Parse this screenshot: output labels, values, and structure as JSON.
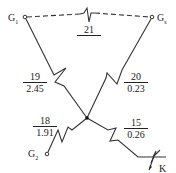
{
  "nodes": {
    "g1": {
      "label": "G",
      "sub": "1"
    },
    "gs": {
      "label": "G",
      "sub": "s"
    },
    "g2": {
      "label": "G",
      "sub": "2"
    },
    "k": {
      "label": "K"
    }
  },
  "branches": {
    "b21": {
      "num": "21",
      "den": ""
    },
    "b19": {
      "num": "19",
      "den": "2.45"
    },
    "b20": {
      "num": "20",
      "den": "0.23"
    },
    "b18": {
      "num": "18",
      "den": "1.91"
    },
    "b15": {
      "num": "15",
      "den": "0.26"
    }
  }
}
